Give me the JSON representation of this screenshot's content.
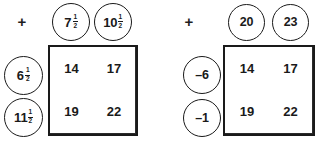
{
  "page": {
    "background_color": "#ffffff",
    "ink_color": "#1a1a1a"
  },
  "puzzles": [
    {
      "id": "puzzle-left",
      "operator": "+",
      "number_type": "mixed-fraction",
      "column_headers": [
        {
          "whole": "7",
          "numerator": "1",
          "denominator": "2",
          "display": "7 1/2"
        },
        {
          "whole": "10",
          "numerator": "1",
          "denominator": "2",
          "display": "10 1/2"
        }
      ],
      "row_headers": [
        {
          "whole": "6",
          "numerator": "1",
          "denominator": "2",
          "display": "6 1/2"
        },
        {
          "whole": "11",
          "numerator": "1",
          "denominator": "2",
          "display": "11 1/2"
        }
      ],
      "grid": {
        "rows": [
          [
            "14",
            "17"
          ],
          [
            "19",
            "22"
          ]
        ]
      }
    },
    {
      "id": "puzzle-right",
      "operator": "+",
      "number_type": "integer",
      "column_headers": [
        {
          "whole": "20",
          "numerator": "",
          "denominator": "",
          "display": "20"
        },
        {
          "whole": "23",
          "numerator": "",
          "denominator": "",
          "display": "23"
        }
      ],
      "row_headers": [
        {
          "whole": "–6",
          "numerator": "",
          "denominator": "",
          "display": "-6"
        },
        {
          "whole": "–1",
          "numerator": "",
          "denominator": "",
          "display": "-1"
        }
      ],
      "grid": {
        "rows": [
          [
            "14",
            "17"
          ],
          [
            "19",
            "22"
          ]
        ]
      }
    }
  ]
}
